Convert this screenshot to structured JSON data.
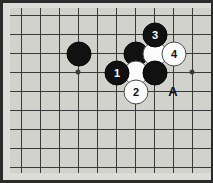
{
  "figure": {
    "kind": "go-board-diagram",
    "width": 213,
    "height": 183,
    "caption": ""
  },
  "colors": {
    "frame": "#2b2b2b",
    "paper": "#dcdcd8",
    "board": "#d2d2cd",
    "grid": "#3a3a3a",
    "black_stone": "#111111",
    "white_stone": "#fbfbfb",
    "label": "#111111"
  },
  "board": {
    "grid_spacing": 19,
    "origin_x": 21,
    "origin_y": 15,
    "vertical_lines_x": [
      21,
      40,
      59,
      78,
      97,
      116,
      135,
      154,
      173,
      192,
      211
    ],
    "horizontal_lines_y": [
      15,
      34,
      53,
      72,
      91,
      110,
      129,
      148,
      167
    ],
    "star_points": [
      {
        "name": "star-point-left",
        "x": 78,
        "y": 72
      },
      {
        "name": "star-point-right",
        "x": 192,
        "y": 72
      }
    ]
  },
  "stones": [
    {
      "id": "black-stone-plain-1",
      "color": "black",
      "x": 78,
      "y": 53,
      "label": ""
    },
    {
      "id": "black-stone-plain-2",
      "color": "black",
      "x": 135,
      "y": 53,
      "label": ""
    },
    {
      "id": "white-stone-plain-1",
      "color": "white",
      "x": 154,
      "y": 53,
      "label": ""
    },
    {
      "id": "white-stone-plain-2",
      "color": "white",
      "x": 135,
      "y": 72,
      "label": ""
    },
    {
      "id": "black-stone-plain-3",
      "color": "black",
      "x": 154,
      "y": 72,
      "label": ""
    },
    {
      "id": "black-stone-move-1",
      "color": "black",
      "x": 116,
      "y": 72,
      "label": "1"
    },
    {
      "id": "white-stone-move-2",
      "color": "white",
      "x": 135,
      "y": 91,
      "label": "2"
    },
    {
      "id": "black-stone-move-3",
      "color": "black",
      "x": 154,
      "y": 34,
      "label": "3"
    },
    {
      "id": "white-stone-move-4",
      "color": "white",
      "x": 173,
      "y": 53,
      "label": "4"
    }
  ],
  "point_labels": [
    {
      "id": "point-label-a",
      "text": "A",
      "x": 173,
      "y": 91
    }
  ]
}
